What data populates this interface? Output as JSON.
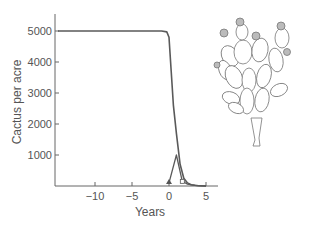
{
  "chart_data": {
    "type": "line",
    "title": "",
    "xlabel": "Years",
    "ylabel": "Cactus per acre",
    "xlim": [
      -15,
      6
    ],
    "ylim": [
      0,
      5500
    ],
    "xticks": [
      -10,
      -5,
      0,
      5
    ],
    "xtick_labels": [
      "−10",
      "−5",
      "0",
      "5"
    ],
    "yticks": [
      1000,
      2000,
      3000,
      4000,
      5000
    ],
    "ytick_labels": [
      "1000",
      "2000",
      "3000",
      "4000",
      "5000"
    ],
    "grid": false,
    "legend": null,
    "series": [
      {
        "name": "cactus density",
        "x": [
          -15,
          -5,
          -1,
          -0.3,
          0,
          0.3,
          0.6,
          1,
          1.5,
          2,
          2.5,
          3,
          4,
          5
        ],
        "y": [
          5000,
          5000,
          5000,
          4970,
          4800,
          3700,
          2600,
          1700,
          700,
          250,
          100,
          40,
          5,
          0
        ],
        "marker": "none"
      },
      {
        "name": "second series (triangle marker)",
        "x": [
          0,
          1,
          1.8,
          2.5,
          3.5,
          5
        ],
        "y": [
          100,
          1000,
          150,
          60,
          20,
          0
        ],
        "marker": [
          "triangle",
          "none",
          "square",
          "none",
          "none",
          "none"
        ]
      }
    ],
    "annotations": [
      "illustration of prickly pear cactus (Opuntia) at upper right"
    ]
  },
  "illustration": {
    "subject": "prickly-pear-cactus"
  }
}
